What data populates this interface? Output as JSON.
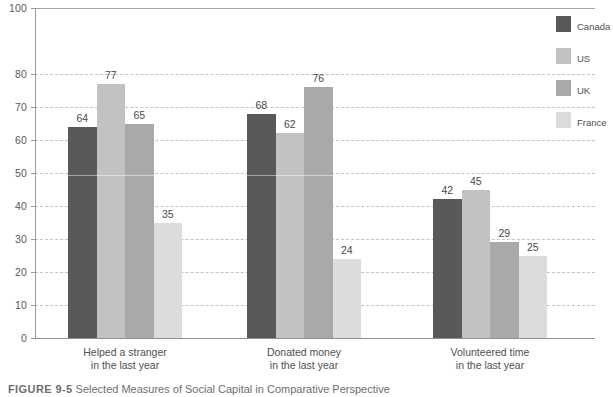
{
  "chart_data": {
    "type": "bar",
    "title": "",
    "xlabel": "",
    "ylabel": "",
    "ylim": [
      0,
      100
    ],
    "grid": true,
    "legend_position": "right",
    "categories": [
      "Helped a stranger in the last year",
      "Donated money in the last year",
      "Volunteered time in the last year"
    ],
    "category_lines": [
      [
        "Helped a stranger",
        "in the last year"
      ],
      [
        "Donated money",
        "in the last year"
      ],
      [
        "Volunteered time",
        "in the last year"
      ]
    ],
    "series": [
      {
        "name": "Canada",
        "color": "#595959",
        "values": [
          64,
          68,
          42
        ]
      },
      {
        "name": "US",
        "color": "#c2c2c2",
        "values": [
          77,
          62,
          45
        ]
      },
      {
        "name": "UK",
        "color": "#a9a9a9",
        "values": [
          65,
          76,
          29
        ]
      },
      {
        "name": "France",
        "color": "#dcdcdc",
        "values": [
          35,
          24,
          25
        ]
      }
    ],
    "y_ticks": [
      0,
      10,
      20,
      30,
      40,
      50,
      60,
      70,
      80,
      100
    ],
    "y_tick_labels": [
      "0",
      "10",
      "20",
      "30",
      "40",
      "50",
      "60",
      "70",
      "80",
      "100"
    ],
    "gridline_color": "#b9c6d2",
    "axis_color": "#9a9a9a"
  },
  "legend": {
    "items": [
      {
        "label": "Canada"
      },
      {
        "label": "US"
      },
      {
        "label": "UK"
      },
      {
        "label": "France"
      }
    ]
  },
  "caption": {
    "figure_number": "FIGURE 9-5",
    "text": "Selected Measures of Social Capital in Comparative Perspective"
  }
}
